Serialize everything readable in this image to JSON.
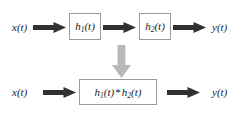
{
  "diagram": {
    "colors": {
      "background": "#ffffff",
      "arrow_dark": "#333031",
      "arrow_gray": "#b8b8b8",
      "block_border": "#9a9a9a",
      "text": "#201d1d"
    },
    "rows": [
      {
        "name": "cascade-row",
        "input_label": "x(t)",
        "output_label": "y(t)",
        "blocks": [
          {
            "name": "block-h1",
            "base": "h",
            "sub": "1",
            "arg": "(t)",
            "text": "h1(t)"
          },
          {
            "name": "block-h2",
            "base": "h",
            "sub": "2",
            "arg": "(t)",
            "text": "h2(t)"
          }
        ],
        "arrows": [
          {
            "name": "arrow-input-to-h1",
            "direction": "right"
          },
          {
            "name": "arrow-h1-to-h2",
            "direction": "right"
          },
          {
            "name": "arrow-h2-to-output",
            "direction": "right"
          }
        ]
      },
      {
        "name": "equivalent-row",
        "input_label": "x(t)",
        "output_label": "y(t)",
        "blocks": [
          {
            "name": "block-h1-conv-h2",
            "left_base": "h",
            "left_sub": "1",
            "left_arg": "(t)",
            "operator": "*",
            "right_base": "h",
            "right_sub": "2",
            "right_arg": "(t)",
            "text": "h1(t) * h2(t)"
          }
        ],
        "arrows": [
          {
            "name": "arrow-input-to-conv",
            "direction": "right"
          },
          {
            "name": "arrow-conv-to-output",
            "direction": "right"
          }
        ]
      }
    ],
    "transition_arrow": {
      "name": "equivalence-down-arrow",
      "direction": "down",
      "color": "#b8b8b8"
    }
  }
}
